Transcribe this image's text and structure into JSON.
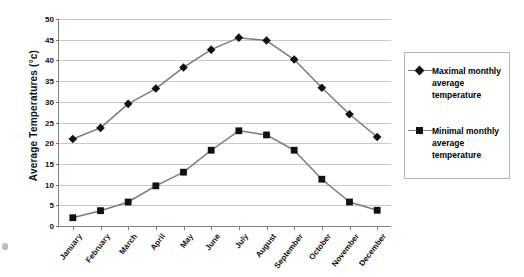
{
  "chart_data": {
    "type": "line",
    "title": "",
    "xlabel": "",
    "ylabel": "Average Temperatures (°c)",
    "ylim": [
      0,
      50
    ],
    "ytick_step": 5,
    "yticks": [
      0,
      5,
      10,
      15,
      20,
      25,
      30,
      35,
      40,
      45,
      50
    ],
    "grid": true,
    "legend_position": "right",
    "categories": [
      "January",
      "February",
      "March",
      "April",
      "May",
      "June",
      "July",
      "August",
      "September",
      "October",
      "November",
      "December"
    ],
    "series": [
      {
        "name": "Maximal monthly average temperature",
        "marker": "diamond",
        "color": "#111111",
        "line_color": "#7a7a7a",
        "values": [
          21.0,
          23.7,
          29.5,
          33.2,
          38.3,
          42.6,
          45.5,
          44.8,
          40.2,
          33.4,
          27.0,
          21.5
        ]
      },
      {
        "name": "Minimal monthly average temperature",
        "marker": "square",
        "color": "#111111",
        "line_color": "#7a7a7a",
        "values": [
          2.0,
          3.7,
          5.8,
          9.7,
          13.0,
          18.3,
          23.0,
          22.0,
          18.3,
          11.3,
          5.8,
          3.8
        ]
      }
    ]
  },
  "axis": {
    "y_title": "Average Temperatures (°c)"
  },
  "legend": {
    "entries": [
      {
        "label": "Maximal monthly average temperature",
        "marker": "diamond"
      },
      {
        "label": "Minimal monthly average temperature",
        "marker": "square"
      }
    ]
  }
}
